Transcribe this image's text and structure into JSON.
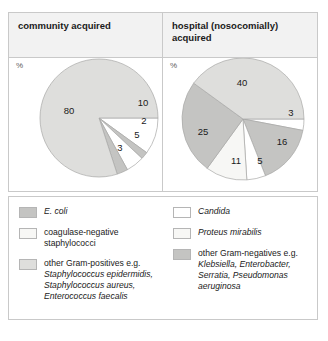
{
  "colors": {
    "panel_border": "#c9c9c9",
    "header_bg": "#f2f2f2",
    "slice_light_gray": "#dededc",
    "slice_medium_gray": "#c4c4c2",
    "slice_white": "#ffffff",
    "slice_near_white": "#f7f7f5",
    "slice_outline": "#a8a8a6",
    "text": "#1a1a1a"
  },
  "columns": {
    "left": {
      "title": "community acquired",
      "axis_unit": "%"
    },
    "right": {
      "title": "hospital (nosocomially) acquired",
      "axis_unit": "%"
    }
  },
  "legend": {
    "left_items": [
      {
        "swatch": "#c4c4c2",
        "text_html": "<span class=\"it\">E. coli</span>",
        "name": "e-coli"
      },
      {
        "swatch": "#f7f7f5",
        "text_html": "coagulase-negative staphylococci",
        "name": "coagulase-negative-staphylococci"
      },
      {
        "swatch": "#dededc",
        "text_html": "other Gram-positives e.g. <span class=\"it\">Staphylococcus epidermidis, Staphylococcus aureus, Enterococcus faecalis</span>",
        "name": "other-gram-positives"
      }
    ],
    "right_items": [
      {
        "swatch": "#ffffff",
        "text_html": "<span class=\"it\">Candida</span>",
        "name": "candida"
      },
      {
        "swatch": "#f7f7f5",
        "text_html": "<span class=\"it\">Proteus mirabilis</span>",
        "name": "proteus-mirabilis"
      },
      {
        "swatch": "#c4c4c2",
        "text_html": "other Gram-negatives e.g. <span class=\"it\">Klebsiella, Enterobacter, Serratia, Pseudomonas aeruginosa</span>",
        "name": "other-gram-negatives"
      }
    ]
  },
  "chart_data": [
    {
      "type": "pie",
      "title": "community acquired",
      "ylabel": "%",
      "total": 100,
      "start_angle_deg": 0,
      "direction": "clockwise",
      "center": [
        90,
        60
      ],
      "radius": 59,
      "labels": [
        "other Gram-positives e.g. Staphylococcus epidermidis, Staphylococcus aureus, Enterococcus faecalis",
        "coagulase-negative staphylococci",
        "E. coli",
        "coagulase-negative staphylococci",
        "E. coli"
      ],
      "slices": [
        {
          "value": 10,
          "color": "#ffffff",
          "label": "coagulase-negative staphylococci",
          "label_pos": [
            44,
            -15
          ]
        },
        {
          "value": 2,
          "color": "#c4c4c2",
          "label": "E. coli",
          "label_pos": [
            45,
            3
          ]
        },
        {
          "value": 5,
          "color": "#ffffff",
          "label": "coagulase-negative staphylococci",
          "label_pos": [
            38,
            17
          ]
        },
        {
          "value": 3,
          "color": "#c4c4c2",
          "label": "E. coli",
          "label_pos": [
            21,
            30
          ]
        },
        {
          "value": 80,
          "color": "#dededc",
          "label": "other Gram-positives",
          "label_pos": [
            -30,
            -7
          ]
        }
      ]
    },
    {
      "type": "pie",
      "title": "hospital (nosocomially) acquired",
      "ylabel": "%",
      "total": 100,
      "start_angle_deg": 0,
      "direction": "clockwise",
      "center": [
        80,
        61
      ],
      "radius": 61,
      "labels": [
        "Candida",
        "other Gram-negatives e.g. Klebsiella, Enterobacter, Serratia, Pseudomonas aeruginosa",
        "Candida",
        "Proteus mirabilis",
        "other Gram-negatives",
        "other Gram-positives"
      ],
      "slices": [
        {
          "value": 3,
          "color": "#ffffff",
          "label": "Candida",
          "label_pos": [
            48,
            -6
          ]
        },
        {
          "value": 16,
          "color": "#c4c4c2",
          "label": "other Gram-negatives",
          "label_pos": [
            39,
            23
          ]
        },
        {
          "value": 5,
          "color": "#ffffff",
          "label": "Candida",
          "label_pos": [
            17,
            42
          ]
        },
        {
          "value": 11,
          "color": "#f7f7f5",
          "label": "Proteus mirabilis",
          "label_pos": [
            -7,
            42
          ]
        },
        {
          "value": 25,
          "color": "#c4c4c2",
          "label": "other Gram-negatives",
          "label_pos": [
            -40,
            13
          ]
        },
        {
          "value": 40,
          "color": "#dededc",
          "label": "other Gram-positives",
          "label_pos": [
            -1,
            -36
          ]
        }
      ]
    }
  ]
}
